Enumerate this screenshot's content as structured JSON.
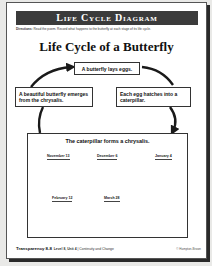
{
  "header": {
    "title": "Life Cycle Diagram",
    "directions_label": "Directions:",
    "directions_text": "Read the poem. Record what happens to the butterfly at each stage of its life cycle."
  },
  "diagram": {
    "title": "Life Cycle of a Butterfly",
    "stages": [
      {
        "text": "A butterfly lays eggs."
      },
      {
        "text": "Each egg hatches into a caterpillar."
      },
      {
        "text": "The caterpillar forms a chrysalis."
      },
      {
        "text": "A beautiful butterfly emerges from the chrysalis."
      }
    ],
    "dates": [
      "November 13",
      "December 6",
      "January 4",
      "February 12",
      "March 28"
    ],
    "arrow_color": "#1a1a1a"
  },
  "footer": {
    "transparency_label": "Transparency",
    "transparency_number": "8-8",
    "level_unit": "Level 8, Unit 4",
    "unit_title": "Continuity and Change",
    "copyright": "© Hampton-Brown"
  },
  "colors": {
    "title_bar": "#3b3b3b",
    "page_bg": "#ffffff",
    "backdrop": "#e9e9e7"
  }
}
